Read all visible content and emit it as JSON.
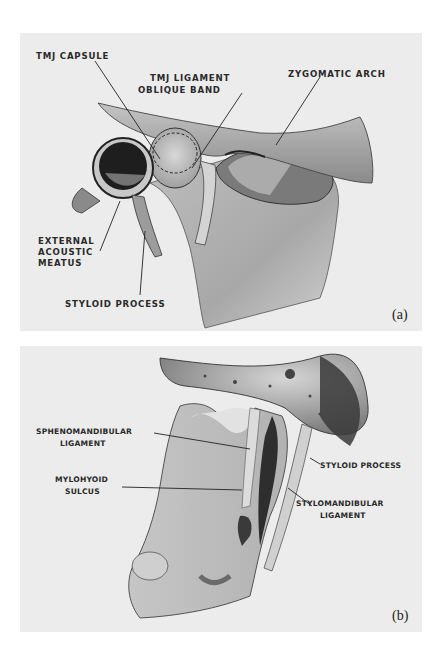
{
  "figure": {
    "panels": [
      {
        "id": "a",
        "tag": "(a)",
        "labels": {
          "tmj_capsule": "TMJ CAPSULE",
          "tmj_ligament_line1": "TMJ LIGAMENT",
          "tmj_ligament_line2": "OBLIQUE BAND",
          "zygomatic_arch": "ZYGOMATIC ARCH",
          "external_acoustic_line1": "EXTERNAL",
          "external_acoustic_line2": "ACOUSTIC",
          "external_acoustic_line3": "MEATUS",
          "styloid_process": "STYLOID PROCESS"
        }
      },
      {
        "id": "b",
        "tag": "(b)",
        "labels": {
          "sphenomandibular_line1": "SPHENOMANDIBULAR",
          "sphenomandibular_line2": "LIGAMENT",
          "mylohyoid_line1": "MYLOHYOID",
          "mylohyoid_line2": "SULCUS",
          "styloid_process": "STYLOID PROCESS",
          "stylomandibular_line1": "STYLOMANDIBULAR",
          "stylomandibular_line2": "LIGAMENT"
        }
      }
    ],
    "colors": {
      "background": "#ececec",
      "ink": "#2a2a2a",
      "bone": "#c9c9c9",
      "shadow": "#3a3a3a"
    }
  }
}
